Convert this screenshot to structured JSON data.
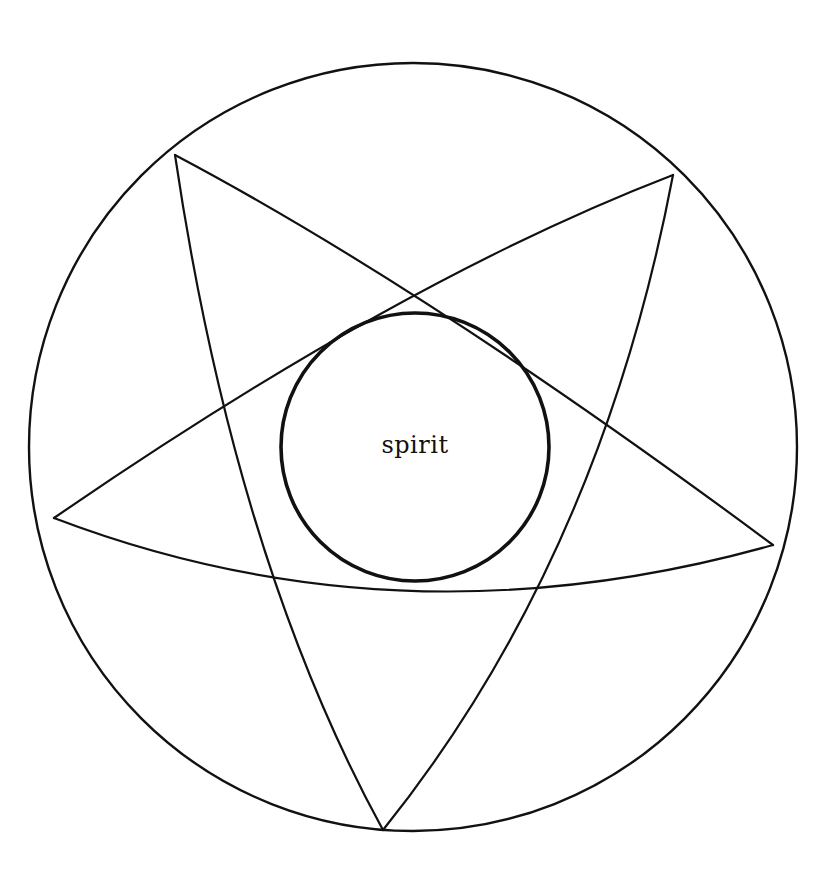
{
  "diagram": {
    "title": "",
    "center_label": "spirit",
    "ink_color": "#111111",
    "background_color": "#ffffff",
    "outer_circle": {
      "cx": 413,
      "cy": 447,
      "r": 384
    },
    "inner_circle": {
      "cx": 415,
      "cy": 447,
      "r": 135
    },
    "vertices": {
      "top_left": [
        175,
        155
      ],
      "top_right": [
        673,
        175
      ],
      "left": [
        54,
        518
      ],
      "right": [
        773,
        545
      ],
      "bottom": [
        383,
        830
      ]
    },
    "edges": [
      {
        "from": "top_left",
        "to": "right"
      },
      {
        "from": "top_left",
        "to": "bottom"
      },
      {
        "from": "top_right",
        "to": "left"
      },
      {
        "from": "top_right",
        "to": "bottom"
      },
      {
        "from": "left",
        "to": "right"
      }
    ]
  }
}
